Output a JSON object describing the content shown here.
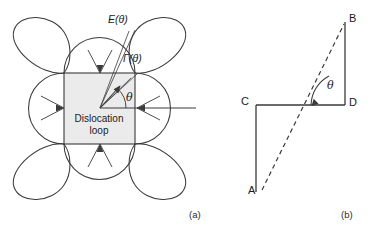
{
  "figure": {
    "background_color": "#ffffff",
    "stroke_color": "#3a3a3a",
    "loop_fill_color": "#ebebeb",
    "panel_a": {
      "caption": "(a)",
      "loop_label_line1": "Dislocation",
      "loop_label_line2": "loop",
      "energy_label": "E(θ)",
      "gamma_label": "Γ(θ)",
      "angle_label": "θ",
      "square": {
        "x": 64,
        "y": 73,
        "width": 71,
        "height": 71
      },
      "center": {
        "x": 100,
        "y": 108
      },
      "reference_line": {
        "x1": 137,
        "y1": 108,
        "x2": 196,
        "y2": 108
      },
      "gamma_arrow": {
        "x1": 100,
        "y1": 108,
        "x2": 120,
        "y2": 86
      },
      "angle_arc_radius": 26,
      "lobe_count": 4,
      "lobe_orientation": "diagonal",
      "side_bulge_count": 4
    },
    "panel_b": {
      "caption": "(b)",
      "angle_label": "θ",
      "points": [
        {
          "name": "A",
          "label": "A",
          "x": 262,
          "y": 192,
          "label_x": 250,
          "label_y": 185
        },
        {
          "name": "B",
          "label": "B",
          "x": 345,
          "y": 22,
          "label_x": 350,
          "label_y": 15
        },
        {
          "name": "C",
          "label": "C",
          "x": 256,
          "y": 105,
          "label_x": 243,
          "label_y": 97
        },
        {
          "name": "D",
          "label": "D",
          "x": 345,
          "y": 105,
          "label_x": 350,
          "label_y": 98
        }
      ],
      "dashed_segment": "A-B",
      "solid_segments": [
        "C-D",
        "D-B",
        "C-Abase"
      ],
      "angle_arc_radius": 34
    }
  }
}
